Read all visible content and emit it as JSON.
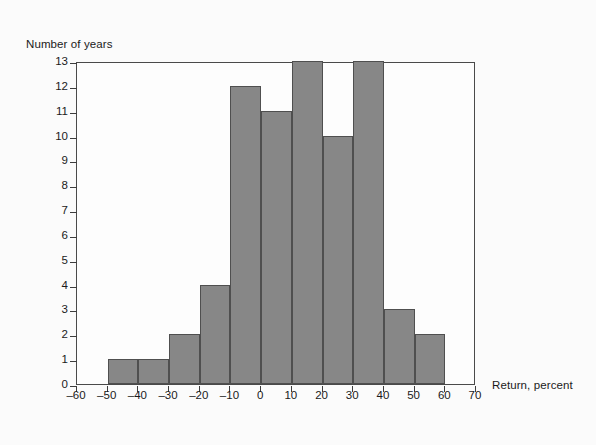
{
  "chart_data": {
    "type": "bar",
    "title": "",
    "subtitle": "",
    "xlabel": "Return, percent",
    "ylabel": "Number of years",
    "grid": false,
    "legend": null,
    "xlim": [
      -60,
      70
    ],
    "ylim": [
      0,
      13
    ],
    "bin_width": 10,
    "xticks": [
      -60,
      -50,
      -40,
      -30,
      -20,
      -10,
      0,
      10,
      20,
      30,
      40,
      50,
      60,
      70
    ],
    "yticks": [
      0,
      1,
      2,
      3,
      4,
      5,
      6,
      7,
      8,
      9,
      10,
      11,
      12,
      13
    ],
    "xtick_labels": [
      "–60",
      "–50",
      "–40",
      "–30",
      "–20",
      "–10",
      "0",
      "10",
      "20",
      "30",
      "40",
      "50",
      "60",
      "70"
    ],
    "ytick_labels": [
      "0",
      "1",
      "2",
      "3",
      "4",
      "5",
      "6",
      "7",
      "8",
      "9",
      "10",
      "11",
      "12",
      "13"
    ],
    "categories": [
      "-60 to -50",
      "-50 to -40",
      "-40 to -30",
      "-30 to -20",
      "-20 to -10",
      "-10 to 0",
      "0 to 10",
      "10 to 20",
      "20 to 30",
      "30 to 40",
      "40 to 50",
      "50 to 60",
      "60 to 70"
    ],
    "bin_edges": [
      -60,
      -50,
      -40,
      -30,
      -20,
      -10,
      0,
      10,
      20,
      30,
      40,
      50,
      60,
      70
    ],
    "values": [
      0,
      1,
      1,
      2,
      4,
      12,
      11,
      13,
      10,
      13,
      3,
      2,
      0
    ],
    "total_count": 59,
    "bar_color": "#878787",
    "bar_edge_color": "#4f4f4f",
    "plot_background": "#fdfdfd",
    "frame_color": "#4a4a4a",
    "page_background": "#fbfbfb"
  }
}
